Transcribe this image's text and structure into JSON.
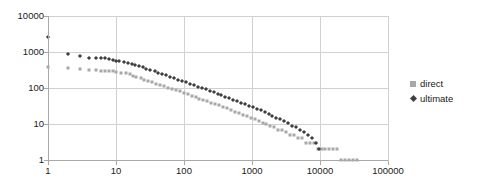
{
  "chart_data": {
    "type": "scatter",
    "title": "",
    "subtitle": "",
    "xlabel": "",
    "ylabel": "",
    "xscale": "log",
    "yscale": "log",
    "xlim": [
      1,
      100000
    ],
    "ylim": [
      1,
      10000
    ],
    "grid": true,
    "legend_position": "right",
    "x_ticks": [
      "1",
      "10",
      "100",
      "1000",
      "10000",
      "100000"
    ],
    "y_ticks": [
      "1",
      "10",
      "100",
      "1000",
      "10000"
    ],
    "x_tick_values": [
      1,
      10,
      100,
      1000,
      10000,
      100000
    ],
    "y_tick_values": [
      1,
      10,
      100,
      1000,
      10000
    ],
    "annotations": [],
    "series": [
      {
        "name": "direct",
        "color": "#a8a8a8",
        "marker": "square",
        "x": [
          1,
          2,
          3,
          4,
          5,
          6,
          7,
          8,
          9,
          10,
          12,
          14,
          16,
          18,
          20,
          23,
          26,
          30,
          34,
          39,
          45,
          51,
          58,
          66,
          76,
          87,
          99,
          113,
          129,
          148,
          169,
          193,
          221,
          252,
          288,
          329,
          376,
          430,
          491,
          561,
          641,
          733,
          837,
          957,
          1093,
          1249,
          1427,
          1631,
          1863,
          2129,
          2433,
          2780,
          3176,
          3629,
          4147,
          4738,
          5414,
          6186,
          7068,
          8076,
          9228,
          10544,
          12047,
          13765,
          15728,
          17971,
          20533,
          23460,
          26804,
          30626,
          34993
        ],
        "y": [
          380,
          355,
          330,
          318,
          308,
          300,
          298,
          296,
          292,
          282,
          268,
          255,
          240,
          222,
          205,
          188,
          172,
          158,
          145,
          133,
          122,
          112,
          103,
          95,
          87,
          80,
          73,
          67,
          61,
          56,
          51,
          47,
          43,
          39,
          36,
          33,
          30,
          27,
          25,
          22,
          20,
          18,
          17,
          15,
          14,
          12,
          11,
          10,
          9,
          8,
          7,
          7,
          6,
          5,
          5,
          4,
          4,
          3,
          3,
          3,
          2,
          2,
          2,
          2,
          2,
          2,
          1,
          1,
          1,
          1,
          1
        ]
      },
      {
        "name": "ultimate",
        "color": "#3f3f3f",
        "marker": "diamond",
        "x": [
          1,
          2,
          3,
          4,
          5,
          6,
          7,
          8,
          9,
          10,
          11,
          13,
          15,
          17,
          19,
          22,
          25,
          28,
          32,
          37,
          42,
          48,
          55,
          63,
          72,
          82,
          94,
          107,
          122,
          140,
          160,
          183,
          209,
          238,
          272,
          311,
          355,
          406,
          463,
          529,
          604,
          690,
          788,
          900,
          1028,
          1174,
          1341,
          1531,
          1749,
          1997,
          2281,
          2605,
          2975,
          3397,
          3880,
          4431,
          5060,
          5779,
          6600,
          7537,
          8607,
          9830
        ],
        "y": [
          2600,
          900,
          780,
          700,
          690,
          680,
          660,
          620,
          600,
          580,
          560,
          530,
          500,
          470,
          440,
          400,
          372,
          345,
          318,
          292,
          268,
          245,
          225,
          206,
          188,
          172,
          157,
          144,
          131,
          120,
          109,
          100,
          91,
          83,
          76,
          69,
          63,
          57,
          52,
          47,
          43,
          39,
          35,
          32,
          29,
          26,
          24,
          21,
          19,
          17,
          15,
          14,
          12,
          11,
          9,
          8,
          7,
          6,
          5,
          4,
          3,
          2
        ]
      }
    ]
  },
  "legend": {
    "items": [
      {
        "label": "direct",
        "marker": "square",
        "color": "#a8a8a8"
      },
      {
        "label": "ultimate",
        "marker": "diamond",
        "color": "#3f3f3f"
      }
    ]
  },
  "colors": {
    "direct": "#a8a8a8",
    "ultimate": "#3f3f3f",
    "grid": "#d0d0d0",
    "axis": "#a9a9a9",
    "text": "#1a1a1a",
    "background": "#ffffff"
  }
}
